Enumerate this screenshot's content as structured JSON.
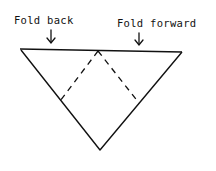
{
  "diagram": {
    "labels": {
      "fold_back": "Fold back",
      "fold_forward": "Fold forward"
    },
    "arrows": {
      "fold_back": "↓",
      "fold_forward": "↓"
    },
    "colors": {
      "ink": "#111111",
      "background": "#ffffff"
    },
    "shape": "inverted-triangle",
    "lines": {
      "solid": "outline",
      "dashed": "fold-lines"
    }
  }
}
